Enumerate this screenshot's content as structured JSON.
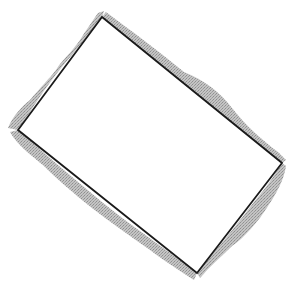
{
  "figure": {
    "width": 303,
    "height": 290,
    "background": "#ffffff",
    "rectangle": {
      "corners": {
        "top": [
          102,
          17
        ],
        "right": [
          282,
          163
        ],
        "bottom": [
          197,
          273
        ],
        "left": [
          18,
          130
        ]
      },
      "stroke_color": "#1a1a1a",
      "stroke_width": 1.8,
      "fill": "#ffffff"
    },
    "shadow": {
      "color": "#b8b8b8",
      "dot_color": "#8f8f8f",
      "style": "stippled"
    }
  }
}
